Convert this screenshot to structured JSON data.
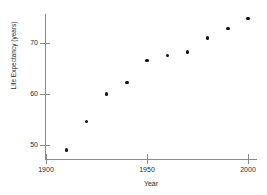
{
  "chart_data": {
    "type": "scatter",
    "title": "",
    "xlabel": "Year",
    "ylabel": "Life Expectancy (years)",
    "x": [
      1910,
      1920,
      1930,
      1940,
      1950,
      1960,
      1970,
      1980,
      1990,
      2000
    ],
    "values": [
      49.0,
      54.6,
      60.0,
      62.3,
      66.6,
      67.5,
      68.2,
      71.0,
      72.8,
      74.8
    ],
    "series": [
      {
        "name": "Life Expectancy",
        "values": [
          49.0,
          54.6,
          60.0,
          62.3,
          66.6,
          67.5,
          68.2,
          71.0,
          72.8,
          74.8
        ]
      }
    ],
    "xticks": [
      1900,
      1950,
      2000
    ],
    "xtick_labels": [
      "1900",
      "1950",
      "2000"
    ],
    "yticks": [
      50,
      60,
      70
    ],
    "ytick_labels": [
      "50",
      "60",
      "70"
    ],
    "xlim": [
      1900,
      2002
    ],
    "ylim": [
      48.6,
      76.6
    ],
    "grid": false,
    "legend": null,
    "marker_color": "#111111",
    "axis_color": "#8a8a8a",
    "background": "#ffffff"
  }
}
